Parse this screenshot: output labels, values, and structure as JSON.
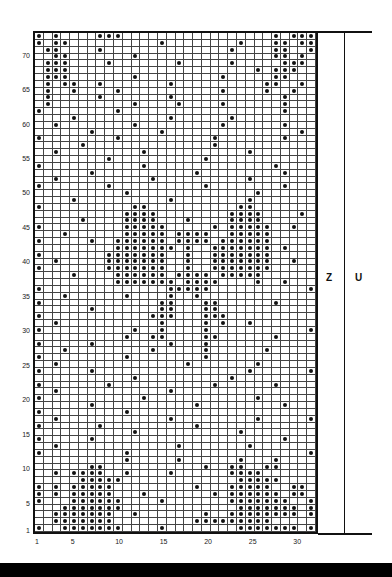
{
  "chart_data": {
    "type": "table",
    "columns": 32,
    "rows": 73,
    "x_tick_labels": [
      "1",
      "5",
      "10",
      "15",
      "20",
      "25",
      "30"
    ],
    "x_tick_positions": [
      1,
      5,
      10,
      15,
      20,
      25,
      30
    ],
    "y_tick_labels": [
      "1",
      "5",
      "10",
      "15",
      "20",
      "25",
      "30",
      "35",
      "40",
      "45",
      "50",
      "55",
      "60",
      "65",
      "70"
    ],
    "y_tick_positions": [
      1,
      5,
      10,
      15,
      20,
      25,
      30,
      35,
      40,
      45,
      50,
      55,
      60,
      65,
      70
    ],
    "section_labels": [
      "Z",
      "U"
    ],
    "legend": {
      "dot": "contrast stitch",
      "blank": "background stitch"
    },
    "rows_top_to_bottom": [
      "X.X....XXX.................X.XXX",
      "X.XX..........X........X...XX.XX",
      ".XX....X..............X....XX..X",
      "..XX.......X...............XX.X.",
      ".XXX....X.......X.....X.....XXX.",
      ".XXX.....................X.XXX..",
      ".XXX.......X.........X.....XX...",
      ".X.XX..X.......X..........XX..X.",
      ".X..X....X...........X....X..X..",
      ".X.....X.......X............X...",
      ".X.........X....X....X......X...",
      "X........X..................X...",
      "....X..........X......X.........",
      "..X........X.........X......X...",
      "......X.......X...............X.",
      "X........X..........X.......X...",
      ".....X..............X...........",
      "..X.........X...........X.......",
      "........X..........X............",
      "X...........X..............X....",
      "......X...........X.........X...",
      "..X..........X..........X.......",
      "X.......X..........X........X...",
      "..........X..............X......",
      "....X..........X........X.......",
      "X..........XX..........XX.......",
      "..........XXXX........XXXX....X.",
      ".....X....XXXX...X....XXXX......",
      "X.........XXXXX.....X.XXXXX..X..",
      "...X......XXXXX.XXXX..XXXXX.....",
      "X.....X..XXXXXX.XXXX.XXXXXX.....",
      ".........XXXXXXX.X..XXXXXXX.X...",
      "X.......XXXXXXX..X..XXXXXXX.....",
      "..X.....XXXXXXX..X..XXXXXXX..X..",
      "X.......XXXXXXX..X..XXXXXXX.....",
      "....X....XXXXXX.XXXX.XXXXX......",
      ".........XXXXXXX.XXXX....X..X...",
      "X..............XXXXX...........X",
      "...X......X....X..X.............",
      "X.............XX...XX......X....",
      "......X.......XX...XX...........",
      "X............XXX...XXX..........",
      "..X...........X....X.X..X.......",
      "X..........X..X....X...........X",
      "..........X..XX....XX......X....",
      "X.....X........X...X............",
      "...X.........X.....X......X.....",
      "X.........X........X............",
      "..X..............X.......X......",
      "X.....X.................X......X",
      "...........X..........X.........",
      "X.......X...........X......X....",
      "..X............X................",
      "X...........X............X......",
      "......X...........X.........X...",
      "X.........X.....................",
      "..X............X.........X.....X",
      "X......X..........X.............",
      "...........X...........X........",
      "X.....X.....................X...",
      "..X.............X.......X.......",
      "X.........X....................X",
      "..........X.....X......X...X....",
      "......XX...........X..XX..XX....",
      "..X.XXXX..X....X......XXXX......",
      ".....XXXXX.............XXXXX....",
      "X.X.XXXXX.........X...XXXXX..XX.",
      "X.X.XXXXX...X.......X.XXXXXX.XX.",
      "X...XXXXXX....X.......XXXXXXX..X",
      "...XXXXXXX.............XXXXXXX.X",
      "..XXXXXXX..X.......X..XXXXXXXX.X",
      "..XXXXXXX.........XXXXXXXXX.....",
      "X..XXXXXXX....X........XXXXXXX.X"
    ]
  },
  "axis": {
    "y_labels": [
      "70",
      "65",
      "60",
      "55",
      "50",
      "45",
      "40",
      "35",
      "30",
      "25",
      "20",
      "15",
      "10",
      "5",
      "1"
    ],
    "x_labels": [
      "1",
      "5",
      "10",
      "15",
      "20",
      "25",
      "30"
    ]
  },
  "sections": {
    "z": "Z",
    "u": "U"
  }
}
